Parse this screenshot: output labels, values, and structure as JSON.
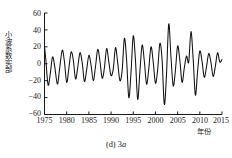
{
  "figure": {
    "caption_prefix": "(d)",
    "caption_scale": "3",
    "caption_unit": "a",
    "caption_full": "(d) 3a"
  },
  "axes": {
    "y_label": "小波系数实部",
    "x_label": "年份",
    "y_ticks": [
      "60",
      "40",
      "20",
      "0",
      "−20",
      "−40",
      "−60"
    ],
    "x_ticks": [
      "1975",
      "1980",
      "1985",
      "1990",
      "1995",
      "2000",
      "2005",
      "2010",
      "2015"
    ],
    "line_color": "#111111",
    "axis_color": "#1a1a1a"
  },
  "chart_data": {
    "type": "line",
    "xlabel": "年份",
    "ylabel": "小波系数实部",
    "xlim": [
      1975,
      2015
    ],
    "ylim": [
      -60,
      60
    ],
    "yticks": [
      -60,
      -40,
      -20,
      0,
      20,
      40,
      60
    ],
    "xticks": [
      1975,
      1980,
      1985,
      1990,
      1995,
      2000,
      2005,
      2010,
      2015
    ],
    "grid": false,
    "legend": null,
    "series": [
      {
        "name": "小波系数实部 (3a)",
        "x": [
          1975.0,
          1975.3,
          1975.8,
          1976.3,
          1976.8,
          1977.3,
          1977.9,
          1978.4,
          1979.0,
          1979.5,
          1980.0,
          1980.5,
          1981.0,
          1981.5,
          1982.0,
          1982.5,
          1983.0,
          1983.5,
          1984.0,
          1984.5,
          1985.0,
          1985.5,
          1986.0,
          1986.5,
          1987.0,
          1987.5,
          1988.0,
          1988.5,
          1989.0,
          1989.5,
          1990.0,
          1990.5,
          1991.0,
          1991.5,
          1992.0,
          1992.5,
          1993.0,
          1993.5,
          1994.0,
          1994.5,
          1995.0,
          1995.5,
          1996.0,
          1996.5,
          1997.0,
          1997.5,
          1998.0,
          1998.5,
          1999.0,
          1999.5,
          2000.0,
          2000.5,
          2001.0,
          2001.5,
          2002.0,
          2002.5,
          2003.0,
          2003.5,
          2004.0,
          2004.5,
          2005.0,
          2005.5,
          2006.0,
          2006.5,
          2007.0,
          2007.5,
          2008.0,
          2008.5,
          2009.0,
          2009.5,
          2010.0,
          2010.5,
          2011.0,
          2011.5,
          2012.0,
          2012.5,
          2013.0,
          2013.5,
          2014.0,
          2014.5,
          2015.0
        ],
        "y": [
          20,
          5,
          -25,
          -12,
          8,
          -3,
          -24,
          -6,
          16,
          2,
          -22,
          -5,
          14,
          4,
          -18,
          -4,
          13,
          1,
          -21,
          -7,
          10,
          -2,
          -20,
          -3,
          17,
          3,
          -17,
          -5,
          18,
          2,
          -14,
          -6,
          19,
          1,
          -20,
          -8,
          30,
          5,
          -40,
          -10,
          33,
          4,
          -42,
          -9,
          22,
          3,
          -24,
          -6,
          20,
          2,
          -23,
          -7,
          24,
          5,
          -48,
          -12,
          47,
          8,
          -26,
          -8,
          21,
          4,
          -22,
          -5,
          9,
          2,
          38,
          6,
          -37,
          -9,
          15,
          3,
          -16,
          -4,
          12,
          2,
          -15,
          -3,
          13,
          2,
          5
        ]
      }
    ]
  }
}
